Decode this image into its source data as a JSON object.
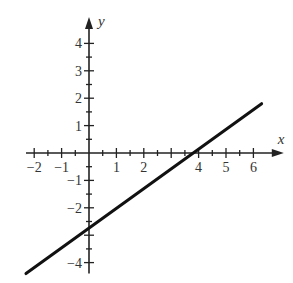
{
  "chart_data": {
    "type": "line",
    "title": "",
    "xlabel": "x",
    "ylabel": "y",
    "xlim": [
      -2.3,
      6.6
    ],
    "ylim": [
      -4.4,
      4.6
    ],
    "grid": false,
    "x_ticks": [
      -2,
      -1,
      1,
      2,
      4,
      5,
      6
    ],
    "x_tick_labels": [
      "−2",
      "−1",
      "1",
      "2",
      "4",
      "5",
      "6"
    ],
    "y_ticks": [
      4,
      3,
      2,
      1,
      -1,
      -2,
      -4
    ],
    "y_tick_labels": [
      "4",
      "3",
      "2",
      "1",
      "−1",
      "−2",
      "−4"
    ],
    "minor_tick_step": 0.5,
    "series": [
      {
        "name": "line",
        "x": [
          -2.3,
          6.3
        ],
        "y": [
          -4.4,
          1.8
        ],
        "x_intercept": 4,
        "y_intercept": -2.8,
        "color": "#111111"
      }
    ]
  },
  "axes": {
    "x_label": "x",
    "y_label": "y"
  }
}
